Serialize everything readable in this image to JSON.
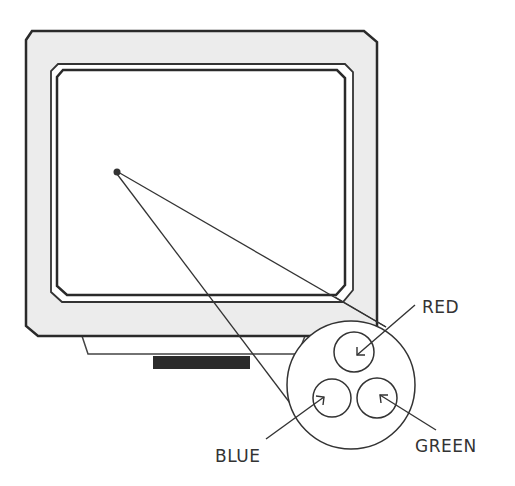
{
  "diagram": {
    "labels": {
      "red": "RED",
      "green": "GREEN",
      "blue": "BLUE"
    },
    "colors": {
      "outline": "#2a2a2a",
      "bezel_fill": "#ececec",
      "screen_fill": "#ffffff",
      "base_bar": "#2b2b2b"
    }
  }
}
